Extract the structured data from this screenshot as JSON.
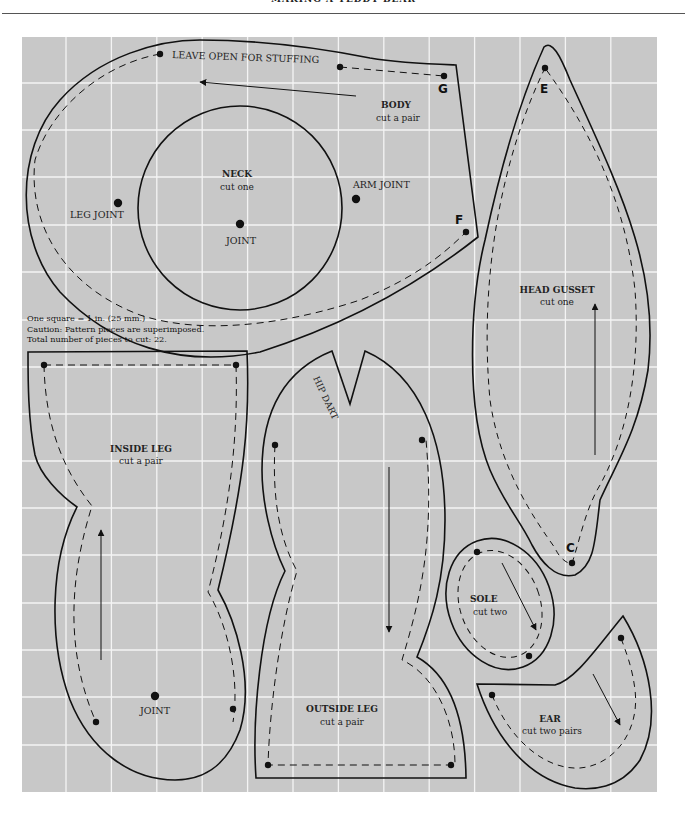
{
  "header": {
    "title": "MAKING A TEDDY BEAR"
  },
  "grid": {
    "background_color": "#c8c8c8",
    "line_color": "#f4f4f4",
    "left": 22,
    "top": 37,
    "right": 657,
    "bottom": 792,
    "square_px": 45.4,
    "columns": 14,
    "scale_note": "One square = 1 in. (25 mm.)"
  },
  "notes": {
    "scale": "One square = 1 in. (25 mm.)",
    "caution": "Caution: Pattern pieces are superimposed.",
    "total": "Total number of pieces to cut: 22."
  },
  "pieces": {
    "body": {
      "name": "BODY",
      "cut": "cut a pair",
      "opening_label": "LEAVE OPEN FOR STUFFING",
      "leg_joint_label": "LEG JOINT",
      "arm_joint_label": "ARM JOINT",
      "point_g": "G",
      "point_f": "F"
    },
    "neck": {
      "name": "NECK",
      "cut": "cut one",
      "joint_label": "JOINT"
    },
    "head_gusset": {
      "name": "HEAD GUSSET",
      "cut": "cut one",
      "point_e": "E",
      "point_c": "C"
    },
    "inside_leg": {
      "name": "INSIDE LEG",
      "cut": "cut a pair",
      "joint_label": "JOINT"
    },
    "outside_leg": {
      "name": "OUTSIDE LEG",
      "cut": "cut a pair",
      "dart_label": "HIP DART"
    },
    "sole": {
      "name": "SOLE",
      "cut": "cut two"
    },
    "ear": {
      "name": "EAR",
      "cut": "cut two pairs"
    }
  },
  "icons": {
    "grain_arrow": "grainline-arrow-icon",
    "marker_dot": "marker-dot-icon"
  }
}
